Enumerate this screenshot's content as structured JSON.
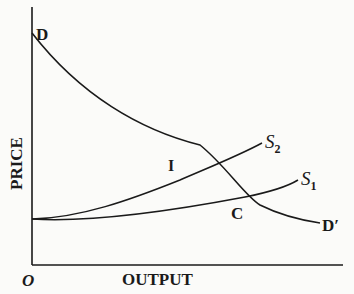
{
  "diagram": {
    "type": "supply-demand",
    "axes": {
      "y_label": "PRICE",
      "x_label": "OUTPUT",
      "origin_label": "O"
    },
    "curves": [
      {
        "id": "demand",
        "start_label": "D",
        "end_label": "D′"
      },
      {
        "id": "supply-2",
        "end_label": "S",
        "subscript": "2"
      },
      {
        "id": "supply-1",
        "end_label": "S",
        "subscript": "1"
      }
    ],
    "points": [
      {
        "id": "intersection-demand-s2",
        "label": "I"
      },
      {
        "id": "intersection-demand-s1",
        "label": "C"
      }
    ],
    "colors": {
      "ink": "#1a1a1a",
      "paper": "#fbfbf9"
    }
  }
}
